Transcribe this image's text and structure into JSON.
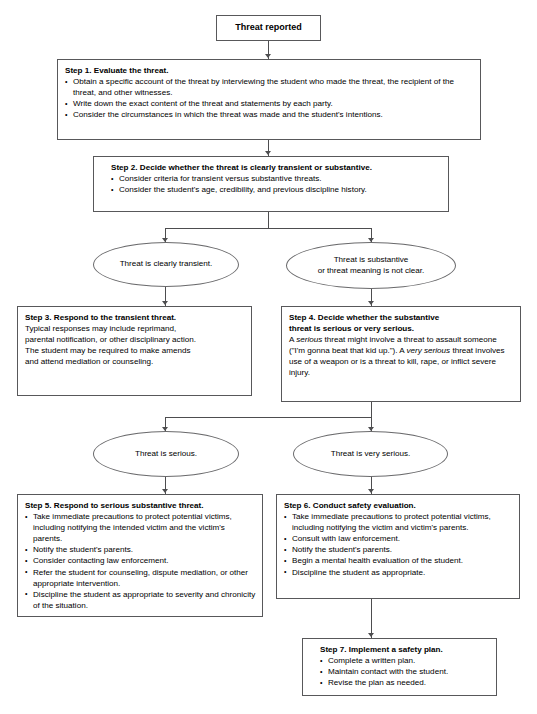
{
  "diagram": {
    "title": "Threat reported",
    "type": "flowchart",
    "nodes": [
      {
        "id": "start",
        "shape": "rect",
        "label": "Threat reported"
      },
      {
        "id": "step1",
        "shape": "rect",
        "title": "Step 1. Evaluate the threat.",
        "bullets": [
          "Obtain a specific account of the threat by interviewing the student who made the threat, the recipient of the threat, and other witnesses.",
          "Write down the exact content of the threat and statements by each party.",
          "Consider the circumstances in which the threat was made and the student's intentions."
        ]
      },
      {
        "id": "step2",
        "shape": "rect",
        "title": "Step 2. Decide whether the threat is clearly transient or substantive.",
        "bullets": [
          "Consider criteria for transient versus substantive threats.",
          "Consider the student's age, credibility, and previous discipline history."
        ]
      },
      {
        "id": "transient",
        "shape": "ellipse",
        "label": "Threat is clearly transient."
      },
      {
        "id": "substantive",
        "shape": "ellipse",
        "label_line1": "Threat is substantive",
        "label_line2": "or threat meaning is not clear."
      },
      {
        "id": "step3",
        "shape": "rect",
        "title": "Step 3. Respond to the transient threat.",
        "lines": [
          "Typical responses may include reprimand,",
          "parental notification, or other disciplinary action.",
          "The student may be required to make amends",
          "and attend mediation or counseling."
        ]
      },
      {
        "id": "step4",
        "shape": "rect",
        "title_line1": "Step 4. Decide whether the substantive",
        "title_line2": "threat is serious or very serious.",
        "body_html": "A <em>serious</em> threat might involve a threat to assault someone (\"I'm gonna beat that kid up.\"). A <em>very serious</em> threat involves use of a weapon or is a threat to kill, rape, or inflict severe injury."
      },
      {
        "id": "serious",
        "shape": "ellipse",
        "label": "Threat is serious."
      },
      {
        "id": "very-serious",
        "shape": "ellipse",
        "label": "Threat is very serious."
      },
      {
        "id": "step5",
        "shape": "rect",
        "title": "Step 5. Respond to serious substantive threat.",
        "bullets": [
          "Take immediate precautions to protect potential victims, including notifying the intended victim and the victim's parents.",
          "Notify the student's parents.",
          "Consider contacting law enforcement.",
          "Refer the student for counseling, dispute mediation, or other appropriate intervention.",
          "Discipline the student as appropriate to severity and chronicity of the situation."
        ]
      },
      {
        "id": "step6",
        "shape": "rect",
        "title": "Step 6. Conduct safety evaluation.",
        "bullets": [
          "Take immediate precautions to protect potential victims, including notifying the victim and victim's parents.",
          "Consult with law enforcement.",
          "Notify the student's parents.",
          "Begin a mental health evaluation of the student.",
          "Discipline the student as appropriate."
        ]
      },
      {
        "id": "step7",
        "shape": "rect",
        "title": "Step 7. Implement a safety plan.",
        "bullets": [
          "Complete a written plan.",
          "Maintain contact with the student.",
          "Revise the plan as needed."
        ]
      }
    ],
    "colors": {
      "border": "#58585a",
      "connector": "#4d4d4f",
      "background": "#ffffff",
      "text": "#000000"
    }
  }
}
